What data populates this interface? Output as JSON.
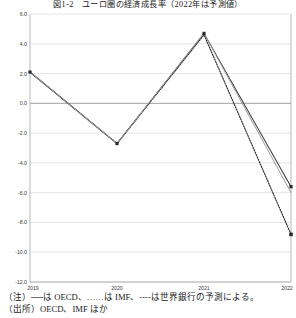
{
  "chart_title": "図1-2　ユーロ圏の経済成長率（2022年は予測値）",
  "notes": {
    "note_prefix": "（注）",
    "note_body": "──は OECD、……は IMF、----は世界銀行の予測による。",
    "note_full": "（注）──は OECD、……は IMF、----は世界銀行の予測による。",
    "source_line": "（出所）OECD、IMF ほか"
  },
  "legend_keys": [
    {
      "label": "OECD",
      "style": "solid",
      "color": "#3a3a3a"
    },
    {
      "label": "IMF",
      "style": "dotted",
      "color": "#2e2e2e"
    },
    {
      "label": "世界銀行",
      "style": "dashed",
      "color": "#9b9b9b"
    }
  ],
  "chart_data": {
    "type": "line",
    "title": "図1-2　ユーロ圏の経済成長率（2022年は予測値）",
    "xlabel": "",
    "ylabel": "",
    "x": [
      "2019",
      "2020",
      "2021",
      "2022"
    ],
    "categories": [
      "2019",
      "2020",
      "2021",
      "2022"
    ],
    "series": [
      {
        "name": "OECD",
        "values": [
          2.1,
          -2.7,
          4.7,
          -5.6
        ]
      },
      {
        "name": "IMF",
        "values": [
          2.1,
          -2.7,
          4.6,
          -8.8
        ]
      },
      {
        "name": "世界銀行",
        "values": [
          2.1,
          -2.7,
          4.7,
          -6.0
        ]
      }
    ],
    "ylim": [
      -12.0,
      6.0
    ],
    "yticks": [
      6.0,
      4.0,
      2.0,
      0.0,
      -2.0,
      -4.0,
      -6.0,
      -8.0,
      -10.0,
      -12.0
    ],
    "ytick_labels": [
      "6.0",
      "4.0",
      "2.0",
      "0.0",
      "-2.0",
      "-4.0",
      "-6.0",
      "-8.0",
      "-10.0",
      "-12.0"
    ],
    "xticks": [
      "2019",
      "2020",
      "2021",
      "2022"
    ],
    "grid": true,
    "legend_position": "none",
    "zero_line": 0.0
  }
}
